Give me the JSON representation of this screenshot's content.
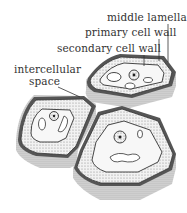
{
  "diagram": {
    "labels": {
      "middle_lamella": "middle lamella",
      "primary_cell_wall": "primary cell wall",
      "secondary_cell_wall": "secondary cell wall",
      "intercellular_space_line1": "intercellular",
      "intercellular_space_line2": "space"
    },
    "colors": {
      "outline": "#3a3a3a",
      "stipple": "#bdbdbd",
      "background": "#ffffff"
    }
  }
}
